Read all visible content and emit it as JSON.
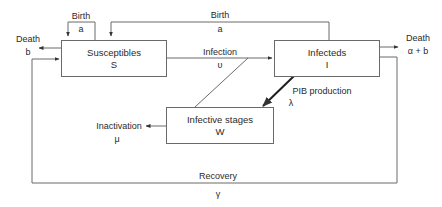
{
  "nodes": {
    "susceptibles": {
      "title": "Susceptibles",
      "symbol": "S"
    },
    "infecteds": {
      "title": "Infecteds",
      "symbol": "I"
    },
    "infective_stages": {
      "title": "Infective stages",
      "symbol": "W"
    }
  },
  "edges": {
    "birth_self": {
      "label": "Birth",
      "param": "a"
    },
    "birth_from_infected": {
      "label": "Birth",
      "param": "a"
    },
    "death_susceptible": {
      "label": "Death",
      "param": "b"
    },
    "infection": {
      "label": "Infection",
      "param": "υ"
    },
    "death_infected": {
      "label": "Death",
      "param": "α + b"
    },
    "pib_production": {
      "label": "PIB production",
      "param": "λ"
    },
    "inactivation": {
      "label": "Inactivation",
      "param": "μ"
    },
    "recovery": {
      "label": "Recovery",
      "param": "γ"
    }
  },
  "colors": {
    "line": "#6a6a6a",
    "thick_arrow": "#1e1e1e",
    "text": "#2a2a2a"
  }
}
